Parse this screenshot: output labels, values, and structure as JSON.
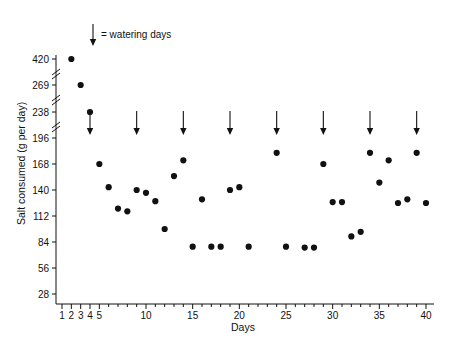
{
  "chart_data": {
    "type": "scatter",
    "title": "",
    "xlabel": "Days",
    "ylabel": "Salt consumed (g per day)",
    "xlim": [
      1,
      40
    ],
    "ylim": [
      0,
      434
    ],
    "grid": false,
    "legend_position": "top-left",
    "x_ticks_major": [
      1,
      2,
      3,
      4,
      5,
      10,
      15,
      20,
      25,
      30,
      35,
      40
    ],
    "x_tick_labels": [
      "1",
      "2",
      "3",
      "4",
      "5",
      "10",
      "15",
      "20",
      "25",
      "30",
      "35",
      "40"
    ],
    "x_ticks_minor": [
      6,
      7,
      8,
      9,
      11,
      12,
      13,
      14,
      16,
      17,
      18,
      19,
      21,
      22,
      23,
      24,
      26,
      27,
      28,
      29,
      31,
      32,
      33,
      34,
      36,
      37,
      38,
      39
    ],
    "y_ticks": [
      28,
      56,
      84,
      112,
      140,
      168,
      196,
      238,
      269,
      420
    ],
    "y_tick_labels": [
      "28",
      "56",
      "84",
      "112",
      "140",
      "168",
      "196",
      "238",
      "269",
      "420"
    ],
    "y_axis_breaks": [
      {
        "between": [
          238,
          269
        ],
        "label": "axis-break-upper"
      },
      {
        "between": [
          269,
          420
        ],
        "label": "axis-break-top"
      },
      {
        "between": [
          196,
          238
        ],
        "label": "axis-break-lower"
      }
    ],
    "annotations": [
      {
        "name": "watering-days-legend",
        "text": "= watering days",
        "symbol": "down-arrow"
      }
    ],
    "watering_days": [
      4,
      9,
      14,
      19,
      24,
      29,
      34,
      39
    ],
    "series": [
      {
        "name": "Salt consumed",
        "marker": "filled-circle",
        "color": "#111111",
        "points": [
          {
            "x": 2,
            "y": 420
          },
          {
            "x": 3,
            "y": 269
          },
          {
            "x": 4,
            "y": 238
          },
          {
            "x": 5,
            "y": 168
          },
          {
            "x": 6,
            "y": 143
          },
          {
            "x": 7,
            "y": 120
          },
          {
            "x": 8,
            "y": 117
          },
          {
            "x": 9,
            "y": 140
          },
          {
            "x": 10,
            "y": 137
          },
          {
            "x": 11,
            "y": 128
          },
          {
            "x": 12,
            "y": 98
          },
          {
            "x": 13,
            "y": 155
          },
          {
            "x": 14,
            "y": 172
          },
          {
            "x": 15,
            "y": 79
          },
          {
            "x": 16,
            "y": 130
          },
          {
            "x": 17,
            "y": 79
          },
          {
            "x": 18,
            "y": 79
          },
          {
            "x": 19,
            "y": 140
          },
          {
            "x": 20,
            "y": 143
          },
          {
            "x": 21,
            "y": 79
          },
          {
            "x": 24,
            "y": 180
          },
          {
            "x": 25,
            "y": 79
          },
          {
            "x": 27,
            "y": 78
          },
          {
            "x": 28,
            "y": 78
          },
          {
            "x": 29,
            "y": 168
          },
          {
            "x": 30,
            "y": 127
          },
          {
            "x": 31,
            "y": 127
          },
          {
            "x": 32,
            "y": 90
          },
          {
            "x": 33,
            "y": 95
          },
          {
            "x": 34,
            "y": 180
          },
          {
            "x": 35,
            "y": 148
          },
          {
            "x": 36,
            "y": 172
          },
          {
            "x": 37,
            "y": 126
          },
          {
            "x": 38,
            "y": 130
          },
          {
            "x": 39,
            "y": 180
          },
          {
            "x": 40,
            "y": 126
          }
        ]
      }
    ]
  },
  "labels": {
    "y_axis_title": "Salt consumed (g per day)",
    "x_axis_title": "Days",
    "legend_label": "= watering days"
  }
}
